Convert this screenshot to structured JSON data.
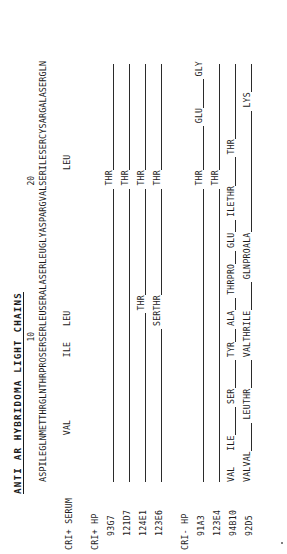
{
  "figure": {
    "title": "ANTI AR HYBRIDOMA LIGHT CHAINS",
    "position_markers": [
      {
        "label": "10",
        "residue_index": 9
      },
      {
        "label": "20",
        "residue_index": 19
      }
    ],
    "consensus_sequence": [
      "ASP",
      "ILE",
      "GLN",
      "MET",
      "THR",
      "GLN",
      "THR",
      "PRO",
      "SER",
      "SER",
      "LEU",
      "SER",
      "ALA",
      "SER",
      "LEU",
      "GLY",
      "ASP",
      "ARG",
      "VAL",
      "SER",
      "ILE",
      "SER",
      "CYS",
      "ARG",
      "ALA",
      "SER",
      "GLN"
    ],
    "groups": [
      {
        "group_label": "CRI+ SERUM",
        "rows": [
          {
            "label": "CRI+ SERUM",
            "is_header": true,
            "substitutions": [
              {
                "residue_index": 3,
                "text": "VAL"
              },
              {
                "residue_index": 8,
                "text": "ILE"
              },
              {
                "residue_index": 10,
                "text": "LEU"
              },
              {
                "residue_index": 20,
                "text": "LEU"
              }
            ],
            "segments": []
          }
        ]
      },
      {
        "group_label": "CRI+ HP",
        "rows": [
          {
            "label": "CRI+ HP",
            "is_header": true,
            "substitutions": [],
            "segments": []
          },
          {
            "label": "93G7",
            "is_header": false,
            "substitutions": [
              {
                "residue_index": 19,
                "text": "THR"
              }
            ],
            "segments": [
              {
                "start": 0,
                "end": 19
              },
              {
                "start": 20,
                "end": 27
              }
            ]
          },
          {
            "label": "121D7",
            "is_header": false,
            "substitutions": [
              {
                "residue_index": 19,
                "text": "THR"
              }
            ],
            "segments": [
              {
                "start": 0,
                "end": 19
              },
              {
                "start": 20,
                "end": 27
              }
            ]
          },
          {
            "label": "124E1",
            "is_header": false,
            "substitutions": [
              {
                "residue_index": 11,
                "text": "THR"
              },
              {
                "residue_index": 19,
                "text": "THR"
              }
            ],
            "segments": [
              {
                "start": 0,
                "end": 11
              },
              {
                "start": 12,
                "end": 19
              },
              {
                "start": 20,
                "end": 27
              }
            ]
          },
          {
            "label": "123E6",
            "is_header": false,
            "substitutions": [
              {
                "residue_index": 10,
                "text": "SER"
              },
              {
                "residue_index": 11,
                "text": "THR"
              },
              {
                "residue_index": 19,
                "text": "THR"
              }
            ],
            "segments": [
              {
                "start": 0,
                "end": 10
              },
              {
                "start": 12,
                "end": 19
              },
              {
                "start": 20,
                "end": 27
              }
            ]
          }
        ]
      },
      {
        "group_label": "CRI- HP",
        "rows": [
          {
            "label": "CRI- HP",
            "is_header": true,
            "substitutions": [],
            "segments": []
          },
          {
            "label": "91A3",
            "is_header": false,
            "substitutions": [
              {
                "residue_index": 19,
                "text": "THR"
              },
              {
                "residue_index": 23,
                "text": "GLU"
              },
              {
                "residue_index": 26,
                "text": "GLY"
              }
            ],
            "segments": [
              {
                "start": 0,
                "end": 19
              },
              {
                "start": 20,
                "end": 23
              },
              {
                "start": 24,
                "end": 26
              }
            ]
          },
          {
            "label": "123E4",
            "is_header": false,
            "substitutions": [
              {
                "residue_index": 19,
                "text": "THR"
              }
            ],
            "segments": [
              {
                "start": 0,
                "end": 19
              },
              {
                "start": 20,
                "end": 27
              }
            ]
          },
          {
            "label": "94B10",
            "is_header": false,
            "substitutions": [
              {
                "residue_index": 0,
                "text": "VAL"
              },
              {
                "residue_index": 2,
                "text": "ILE"
              },
              {
                "residue_index": 5,
                "text": "SER"
              },
              {
                "residue_index": 8,
                "text": "TYR"
              },
              {
                "residue_index": 10,
                "text": "ALA"
              },
              {
                "residue_index": 12,
                "text": "THR"
              },
              {
                "residue_index": 13,
                "text": "PRO"
              },
              {
                "residue_index": 15,
                "text": "GLU"
              },
              {
                "residue_index": 17,
                "text": "ILE"
              },
              {
                "residue_index": 18,
                "text": "THR"
              },
              {
                "residue_index": 21,
                "text": "THR"
              }
            ],
            "segments": [
              {
                "start": 3,
                "end": 5
              },
              {
                "start": 6,
                "end": 8
              },
              {
                "start": 9,
                "end": 10
              },
              {
                "start": 11,
                "end": 12
              },
              {
                "start": 14,
                "end": 15
              },
              {
                "start": 16,
                "end": 17
              },
              {
                "start": 19,
                "end": 21
              },
              {
                "start": 22,
                "end": 27
              }
            ]
          },
          {
            "label": "92D5",
            "is_header": false,
            "substitutions": [
              {
                "residue_index": 0,
                "text": "VAL"
              },
              {
                "residue_index": 1,
                "text": "VAL"
              },
              {
                "residue_index": 4,
                "text": "LEU"
              },
              {
                "residue_index": 5,
                "text": "THR"
              },
              {
                "residue_index": 8,
                "text": "VAL"
              },
              {
                "residue_index": 9,
                "text": "THR"
              },
              {
                "residue_index": 10,
                "text": "ILE"
              },
              {
                "residue_index": 13,
                "text": "GLN"
              },
              {
                "residue_index": 14,
                "text": "PRO"
              },
              {
                "residue_index": 15,
                "text": "ALA"
              },
              {
                "residue_index": 24,
                "text": "LYS"
              }
            ],
            "segments": [
              {
                "start": 2,
                "end": 4
              },
              {
                "start": 6,
                "end": 8
              },
              {
                "start": 11,
                "end": 13
              },
              {
                "start": 16,
                "end": 24
              },
              {
                "start": 25,
                "end": 27
              }
            ]
          }
        ]
      }
    ]
  }
}
